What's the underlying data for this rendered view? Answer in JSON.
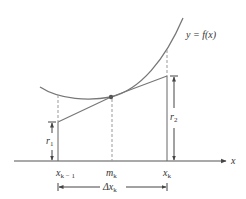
{
  "figure": {
    "curve_label": "y = f(x)",
    "axis_label": "x",
    "ticks": {
      "left": {
        "base": "x",
        "sub": "k − 1"
      },
      "mid": {
        "base": "m",
        "sub": "k"
      },
      "right": {
        "base": "x",
        "sub": "k"
      }
    },
    "heights": {
      "r1": {
        "base": "r",
        "sub": "1"
      },
      "r2": {
        "base": "r",
        "sub": "2"
      }
    },
    "width_label": {
      "base": "Δx",
      "sub": "k"
    },
    "colors": {
      "curve": "#777777",
      "line": "#777777",
      "axis": "#555555",
      "dashed": "#999999",
      "text": "#333333"
    }
  }
}
